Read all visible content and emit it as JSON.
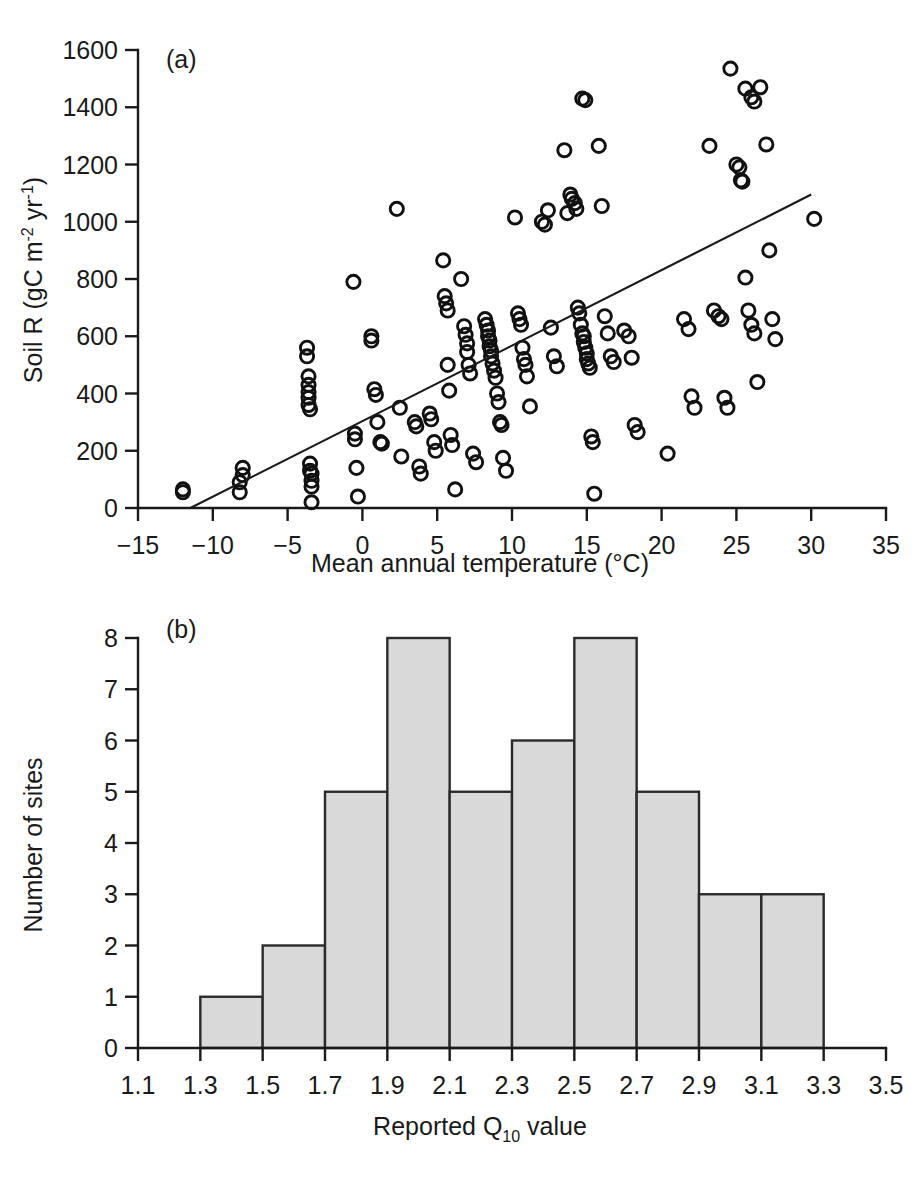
{
  "figure": {
    "background_color": "#ffffff",
    "ink_color": "#1a1a1a",
    "bar_fill_color": "#d9d9d9",
    "bar_edge_color": "#2b2b2b"
  },
  "panel_a": {
    "label": "(a)",
    "xlabel_main": "Mean annual temperature (",
    "xlabel_degree": "°C",
    "xlabel_close": ")",
    "ylabel_main": "Soil R (gC m",
    "ylabel_sup1": "-2",
    "ylabel_mid": " yr",
    "ylabel_sup2": "-1",
    "ylabel_close": ")"
  },
  "panel_b": {
    "label": "(b)",
    "xlabel_main": "Reported Q",
    "xlabel_sub": "10",
    "xlabel_tail": " value",
    "ylabel": "Number of sites"
  },
  "chart_data": [
    {
      "type": "scatter",
      "panel": "(a)",
      "title": "",
      "xlabel": "Mean annual temperature (°C)",
      "ylabel": "Soil R (gC m-2 yr-1)",
      "xlim": [
        -15,
        35
      ],
      "ylim": [
        0,
        1600
      ],
      "xticks": [
        -15,
        -10,
        -5,
        0,
        5,
        10,
        15,
        20,
        25,
        30,
        35
      ],
      "xtick_labels": [
        "-15",
        "-10",
        "-5",
        "0",
        "5",
        "10",
        "15",
        "20",
        "25",
        "30",
        "35"
      ],
      "yticks": [
        0,
        200,
        400,
        600,
        800,
        1000,
        1200,
        1400,
        1600
      ],
      "ytick_labels": [
        "0",
        "200",
        "400",
        "600",
        "800",
        "1000",
        "1200",
        "1400",
        "1600"
      ],
      "grid": false,
      "legend": null,
      "marker": "open-circle",
      "trendline": {
        "type": "linear",
        "x_start": -11.5,
        "y_start": 0,
        "x_end": 30.0,
        "y_end": 1095,
        "slope": 26.4,
        "intercept": 303
      },
      "points": [
        [
          -12.0,
          65
        ],
        [
          -12.0,
          55
        ],
        [
          -8.2,
          90
        ],
        [
          -8.2,
          55
        ],
        [
          -8.0,
          140
        ],
        [
          -8.0,
          115
        ],
        [
          -3.7,
          560
        ],
        [
          -3.7,
          530
        ],
        [
          -3.6,
          460
        ],
        [
          -3.6,
          430
        ],
        [
          -3.6,
          405
        ],
        [
          -3.6,
          385
        ],
        [
          -3.6,
          360
        ],
        [
          -3.5,
          345
        ],
        [
          -3.5,
          155
        ],
        [
          -3.5,
          130
        ],
        [
          -3.4,
          120
        ],
        [
          -3.4,
          95
        ],
        [
          -3.4,
          75
        ],
        [
          -3.4,
          20
        ],
        [
          -0.6,
          790
        ],
        [
          -0.5,
          260
        ],
        [
          -0.5,
          240
        ],
        [
          -0.4,
          140
        ],
        [
          -0.3,
          40
        ],
        [
          0.6,
          600
        ],
        [
          0.6,
          585
        ],
        [
          0.8,
          415
        ],
        [
          0.9,
          395
        ],
        [
          1.0,
          300
        ],
        [
          1.2,
          230
        ],
        [
          1.3,
          225
        ],
        [
          2.3,
          1045
        ],
        [
          2.5,
          350
        ],
        [
          2.6,
          180
        ],
        [
          3.5,
          300
        ],
        [
          3.6,
          285
        ],
        [
          3.8,
          145
        ],
        [
          3.9,
          120
        ],
        [
          4.5,
          330
        ],
        [
          4.6,
          310
        ],
        [
          4.8,
          230
        ],
        [
          4.9,
          200
        ],
        [
          5.4,
          865
        ],
        [
          5.5,
          740
        ],
        [
          5.6,
          715
        ],
        [
          5.7,
          690
        ],
        [
          5.7,
          500
        ],
        [
          5.8,
          410
        ],
        [
          5.9,
          255
        ],
        [
          6.0,
          220
        ],
        [
          6.2,
          65
        ],
        [
          6.6,
          800
        ],
        [
          6.8,
          635
        ],
        [
          6.9,
          605
        ],
        [
          7.0,
          575
        ],
        [
          7.0,
          545
        ],
        [
          7.1,
          500
        ],
        [
          7.2,
          470
        ],
        [
          7.4,
          190
        ],
        [
          7.6,
          160
        ],
        [
          8.2,
          660
        ],
        [
          8.3,
          640
        ],
        [
          8.4,
          620
        ],
        [
          8.4,
          600
        ],
        [
          8.5,
          585
        ],
        [
          8.5,
          565
        ],
        [
          8.6,
          550
        ],
        [
          8.6,
          530
        ],
        [
          8.7,
          505
        ],
        [
          8.8,
          480
        ],
        [
          8.9,
          455
        ],
        [
          9.0,
          400
        ],
        [
          9.1,
          370
        ],
        [
          9.2,
          300
        ],
        [
          9.3,
          290
        ],
        [
          9.4,
          175
        ],
        [
          9.6,
          130
        ],
        [
          10.2,
          1015
        ],
        [
          10.4,
          680
        ],
        [
          10.5,
          660
        ],
        [
          10.6,
          640
        ],
        [
          10.7,
          560
        ],
        [
          10.8,
          520
        ],
        [
          10.9,
          500
        ],
        [
          11.0,
          460
        ],
        [
          11.2,
          355
        ],
        [
          12.0,
          1000
        ],
        [
          12.2,
          990
        ],
        [
          12.4,
          1040
        ],
        [
          12.6,
          630
        ],
        [
          12.8,
          530
        ],
        [
          13.0,
          495
        ],
        [
          13.5,
          1250
        ],
        [
          13.7,
          1030
        ],
        [
          13.9,
          1095
        ],
        [
          14.0,
          1080
        ],
        [
          14.2,
          1065
        ],
        [
          14.3,
          1045
        ],
        [
          14.4,
          700
        ],
        [
          14.5,
          680
        ],
        [
          14.6,
          640
        ],
        [
          14.7,
          610
        ],
        [
          14.8,
          600
        ],
        [
          14.8,
          580
        ],
        [
          14.9,
          560
        ],
        [
          15.0,
          540
        ],
        [
          15.0,
          520
        ],
        [
          15.1,
          505
        ],
        [
          15.2,
          490
        ],
        [
          15.3,
          250
        ],
        [
          15.4,
          230
        ],
        [
          15.5,
          50
        ],
        [
          14.7,
          1430
        ],
        [
          14.9,
          1425
        ],
        [
          15.8,
          1265
        ],
        [
          16.0,
          1055
        ],
        [
          16.2,
          670
        ],
        [
          16.4,
          610
        ],
        [
          16.6,
          530
        ],
        [
          16.8,
          510
        ],
        [
          17.5,
          620
        ],
        [
          17.8,
          600
        ],
        [
          18.0,
          525
        ],
        [
          18.2,
          290
        ],
        [
          18.4,
          265
        ],
        [
          20.4,
          190
        ],
        [
          21.5,
          660
        ],
        [
          21.8,
          625
        ],
        [
          22.0,
          390
        ],
        [
          22.2,
          350
        ],
        [
          23.2,
          1265
        ],
        [
          23.5,
          690
        ],
        [
          23.8,
          670
        ],
        [
          24.0,
          660
        ],
        [
          24.2,
          385
        ],
        [
          24.4,
          350
        ],
        [
          24.6,
          1535
        ],
        [
          25.0,
          1200
        ],
        [
          25.2,
          1190
        ],
        [
          25.3,
          1145
        ],
        [
          25.4,
          1140
        ],
        [
          25.6,
          805
        ],
        [
          25.8,
          690
        ],
        [
          26.0,
          640
        ],
        [
          26.2,
          610
        ],
        [
          26.4,
          440
        ],
        [
          25.6,
          1465
        ],
        [
          26.0,
          1435
        ],
        [
          26.2,
          1420
        ],
        [
          26.6,
          1470
        ],
        [
          27.0,
          1270
        ],
        [
          27.2,
          900
        ],
        [
          27.4,
          660
        ],
        [
          27.6,
          590
        ],
        [
          30.2,
          1010
        ]
      ]
    },
    {
      "type": "bar",
      "panel": "(b)",
      "title": "",
      "xlabel": "Reported Q10 value",
      "ylabel": "Number of sites",
      "xlim": [
        1.1,
        3.5
      ],
      "ylim": [
        0,
        8
      ],
      "xticks": [
        1.1,
        1.3,
        1.5,
        1.7,
        1.9,
        2.1,
        2.3,
        2.5,
        2.7,
        2.9,
        3.1,
        3.3,
        3.5
      ],
      "xtick_labels": [
        "1.1",
        "1.3",
        "1.5",
        "1.7",
        "1.9",
        "2.1",
        "2.3",
        "2.5",
        "2.7",
        "2.9",
        "3.1",
        "3.3",
        "3.5"
      ],
      "yticks": [
        0,
        1,
        2,
        3,
        4,
        5,
        6,
        7,
        8
      ],
      "ytick_labels": [
        "0",
        "1",
        "2",
        "3",
        "4",
        "5",
        "6",
        "7",
        "8"
      ],
      "grid": false,
      "legend": null,
      "bin_width": 0.2,
      "bin_edges": [
        1.3,
        1.5,
        1.7,
        1.9,
        2.1,
        2.3,
        2.5,
        2.7,
        2.9,
        3.1,
        3.3
      ],
      "categories": [
        "1.3-1.5",
        "1.5-1.7",
        "1.7-1.9",
        "1.9-2.1",
        "2.1-2.3",
        "2.3-2.5",
        "2.5-2.7",
        "2.7-2.9",
        "2.9-3.1",
        "3.1-3.3"
      ],
      "values": [
        1,
        2,
        5,
        8,
        5,
        6,
        8,
        5,
        3,
        3
      ]
    }
  ]
}
